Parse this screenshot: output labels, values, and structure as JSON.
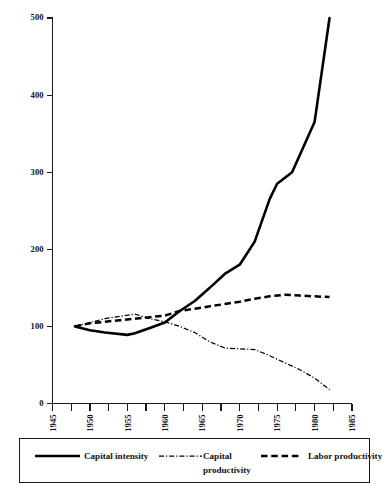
{
  "chart_data": {
    "type": "line",
    "title": "",
    "subtitle": "",
    "xlabel": "",
    "ylabel": "",
    "xlim": [
      1945,
      1985
    ],
    "ylim": [
      0,
      500
    ],
    "grid": false,
    "legend_position": "bottom",
    "y_ticks": [
      0,
      100,
      200,
      300,
      400,
      500
    ],
    "y_tick_labels": [
      "0",
      "100",
      "200",
      "300",
      "400",
      "500"
    ],
    "x_ticks": [
      1945,
      1950,
      1955,
      1960,
      1965,
      1970,
      1975,
      1980,
      1985
    ],
    "x_tick_labels": [
      "1945",
      "1950",
      "1955",
      "1960",
      "1965",
      "1970",
      "1975",
      "1980",
      "1985"
    ],
    "x_minor_ticks": [
      1947.5,
      1952.5,
      1957.5,
      1962.5,
      1967.5,
      1972.5,
      1977.5,
      1982.5
    ],
    "series": [
      {
        "name": "Capital intensity",
        "style": "solid",
        "x": [
          1948,
          1950,
          1952,
          1955,
          1956,
          1958,
          1960,
          1962,
          1964,
          1966,
          1968,
          1970,
          1972,
          1974,
          1975,
          1977,
          1980,
          1982
        ],
        "values": [
          100,
          95,
          92,
          89,
          91,
          98,
          105,
          120,
          133,
          150,
          168,
          180,
          210,
          265,
          285,
          300,
          365,
          500
        ]
      },
      {
        "name": "Capital productivity",
        "style": "dash-dot",
        "x": [
          1948,
          1950,
          1952,
          1954,
          1956,
          1958,
          1960,
          1962,
          1964,
          1966,
          1968,
          1970,
          1972,
          1974,
          1976,
          1978,
          1980,
          1982
        ],
        "values": [
          100,
          105,
          110,
          113,
          116,
          110,
          106,
          100,
          92,
          80,
          72,
          71,
          70,
          62,
          53,
          44,
          33,
          18
        ]
      },
      {
        "name": "Labor productivity",
        "style": "dashed",
        "x": [
          1948,
          1950,
          1952,
          1954,
          1956,
          1958,
          1960,
          1962,
          1964,
          1966,
          1968,
          1970,
          1972,
          1974,
          1976,
          1978,
          1980,
          1982
        ],
        "values": [
          100,
          104,
          106,
          108,
          110,
          112,
          114,
          120,
          123,
          126,
          129,
          132,
          136,
          139,
          141,
          140,
          139,
          138
        ]
      }
    ]
  },
  "legend": {
    "items": [
      {
        "label": "Capital intensity",
        "label_line2": "",
        "style": "solid"
      },
      {
        "label": "Capital",
        "label_line2": "productivity",
        "style": "dash-dot"
      },
      {
        "label": "Labor productivity",
        "label_line2": "",
        "style": "dashed"
      }
    ]
  },
  "colors": {
    "ink": "#000000",
    "axis": "#1a1a1a",
    "background": "#ffffff"
  }
}
